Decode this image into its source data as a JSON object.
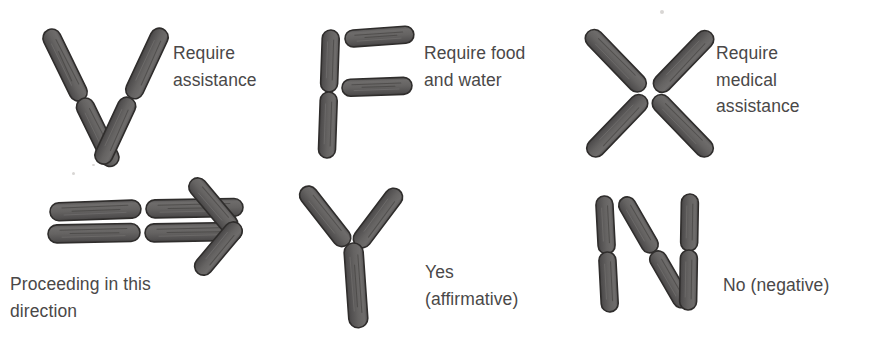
{
  "figure": {
    "background_color": "#ffffff",
    "log_fill_color": "#615f5f",
    "log_stroke_color": "#33312f",
    "text_color": "#4a4848"
  },
  "signals": [
    {
      "id": "require-assistance",
      "symbol_letter": "V",
      "symbol_name": "v-signal",
      "label": "Require\nassistance",
      "label_lines": [
        "Require",
        "assistance"
      ],
      "row": 1,
      "column": 1
    },
    {
      "id": "require-food-and-water",
      "symbol_letter": "F",
      "symbol_name": "f-signal",
      "label": "Require food\nand water",
      "label_lines": [
        "Require food",
        "and water"
      ],
      "row": 1,
      "column": 2
    },
    {
      "id": "require-medical-assistance",
      "symbol_letter": "X",
      "symbol_name": "x-signal",
      "label": "Require\nmedical\nassistance",
      "label_lines": [
        "Require",
        "medical",
        "assistance"
      ],
      "row": 1,
      "column": 3
    },
    {
      "id": "proceeding-in-this-direction",
      "symbol_letter": "⇒",
      "symbol_name": "arrow-signal",
      "label": "Proceeding in this\ndirection",
      "label_lines": [
        "Proceeding in this",
        "direction"
      ],
      "row": 2,
      "column": 1
    },
    {
      "id": "yes-affirmative",
      "symbol_letter": "Y",
      "symbol_name": "y-signal",
      "label": "Yes\n(affirmative)",
      "label_lines": [
        "Yes",
        "(affirmative)"
      ],
      "row": 2,
      "column": 2
    },
    {
      "id": "no-negative",
      "symbol_letter": "N",
      "symbol_name": "n-signal",
      "label": "No (negative)",
      "label_lines": [
        "No (negative)"
      ],
      "row": 2,
      "column": 3
    }
  ]
}
